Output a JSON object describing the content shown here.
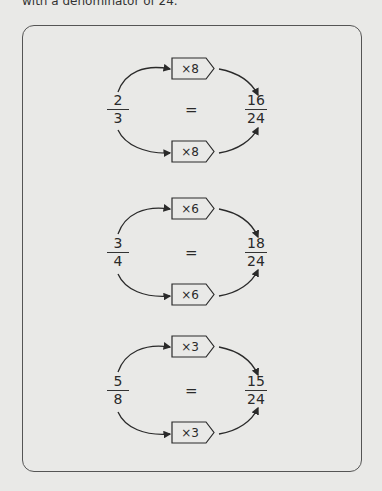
{
  "header": {
    "text": "with a denominator of 24."
  },
  "colors": {
    "background": "#e9e9e7",
    "ink": "#2a2a2a",
    "border": "#555555"
  },
  "diagrams": [
    {
      "left": {
        "num": "2",
        "den": "3"
      },
      "equals": "=",
      "right": {
        "num": "16",
        "den": "24"
      },
      "top_multiplier": "×8",
      "bottom_multiplier": "×8"
    },
    {
      "left": {
        "num": "3",
        "den": "4"
      },
      "equals": "=",
      "right": {
        "num": "18",
        "den": "24"
      },
      "top_multiplier": "×6",
      "bottom_multiplier": "×6"
    },
    {
      "left": {
        "num": "5",
        "den": "8"
      },
      "equals": "=",
      "right": {
        "num": "15",
        "den": "24"
      },
      "top_multiplier": "×3",
      "bottom_multiplier": "×3"
    }
  ]
}
